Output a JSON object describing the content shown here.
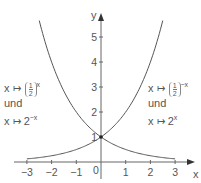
{
  "chart_data": {
    "type": "line",
    "title": "",
    "xlabel": "x",
    "ylabel": "y",
    "xlim": [
      -3.6,
      3.7
    ],
    "ylim": [
      -0.4,
      5.9
    ],
    "grid": false,
    "x_ticks": [
      -3,
      -2,
      -1,
      1,
      2,
      3
    ],
    "x_tick_labels": [
      "−3",
      "−2",
      "−1",
      "1",
      "2",
      "3"
    ],
    "y_ticks": [
      1,
      2,
      3,
      4,
      5
    ],
    "y_tick_labels": [
      "1",
      "2",
      "3",
      "4",
      "5"
    ],
    "origin_label": "0",
    "series": [
      {
        "name": "x ↦ (1/2)^x und x ↦ 2^−x",
        "formula": "2^-x",
        "x": [
          -2.5,
          -2,
          -1.5,
          -1,
          -0.5,
          0,
          0.5,
          1,
          1.5,
          2,
          2.5,
          3
        ],
        "values": [
          5.66,
          4,
          2.83,
          2,
          1.41,
          1,
          0.71,
          0.5,
          0.35,
          0.25,
          0.18,
          0.125
        ]
      },
      {
        "name": "x ↦ (1/2)^−x und x ↦ 2^x",
        "formula": "2^x",
        "x": [
          -3,
          -2.5,
          -2,
          -1.5,
          -1,
          -0.5,
          0,
          0.5,
          1,
          1.5,
          2,
          2.5
        ],
        "values": [
          0.125,
          0.18,
          0.25,
          0.35,
          0.5,
          0.71,
          1,
          1.41,
          2,
          2.83,
          4,
          5.66
        ]
      }
    ],
    "annotations": [
      {
        "text": "intersection point",
        "x": 0,
        "y": 1
      }
    ]
  },
  "labels": {
    "left": {
      "line1_prefix": "x",
      "mapsto": "↦",
      "frac_num": "1",
      "frac_den": "2",
      "line1_exp": "x",
      "line2": "und",
      "line3_prefix": "x",
      "line3_base": "2",
      "line3_exp": "−x"
    },
    "right": {
      "line1_prefix": "x",
      "mapsto": "↦",
      "frac_num": "1",
      "frac_den": "2",
      "line1_exp": "−x",
      "line2": "und",
      "line3_prefix": "x",
      "line3_base": "2",
      "line3_exp": "x"
    }
  },
  "colors": {
    "axis": "#666666",
    "curve": "#555555",
    "text": "#555555"
  }
}
